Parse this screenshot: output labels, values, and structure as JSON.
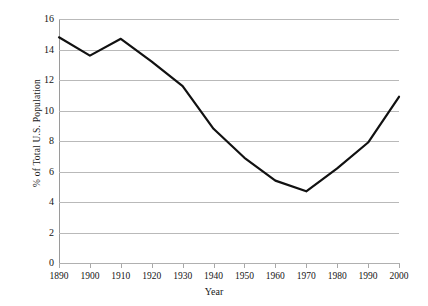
{
  "chart_data": {
    "type": "line",
    "title": "",
    "xlabel": "Year",
    "ylabel": "% of Total U.S. Population",
    "categories": [
      "1890",
      "1900",
      "1910",
      "1920",
      "1930",
      "1940",
      "1950",
      "1960",
      "1970",
      "1980",
      "1990",
      "2000"
    ],
    "x": [
      1890,
      1900,
      1910,
      1920,
      1930,
      1940,
      1950,
      1960,
      1970,
      1980,
      1990,
      2000
    ],
    "values": [
      14.8,
      13.6,
      14.7,
      13.2,
      11.6,
      8.8,
      6.9,
      5.4,
      4.7,
      6.2,
      7.9,
      10.9
    ],
    "series": [
      {
        "name": "% of Total U.S. Population",
        "values": [
          14.8,
          13.6,
          14.7,
          13.2,
          11.6,
          8.8,
          6.9,
          5.4,
          4.7,
          6.2,
          7.9,
          10.9
        ]
      }
    ],
    "xlim": [
      1890,
      2000
    ],
    "ylim": [
      0,
      16
    ],
    "yticks": [
      0,
      2,
      4,
      6,
      8,
      10,
      12,
      14,
      16
    ],
    "ytick_labels": [
      "0",
      "2",
      "4",
      "6",
      "8",
      "10",
      "12",
      "14",
      "16"
    ],
    "xticks": [
      1890,
      1900,
      1910,
      1920,
      1930,
      1940,
      1950,
      1960,
      1970,
      1980,
      1990,
      2000
    ],
    "grid": true,
    "grid_axis": "y",
    "grid_color": "#b9b9b9",
    "legend": false,
    "legend_position": "none",
    "line_color": "#111111",
    "line_width": 2.2,
    "markers": false,
    "background_color": "#ffffff",
    "axis_color": "#a8a8a8"
  }
}
